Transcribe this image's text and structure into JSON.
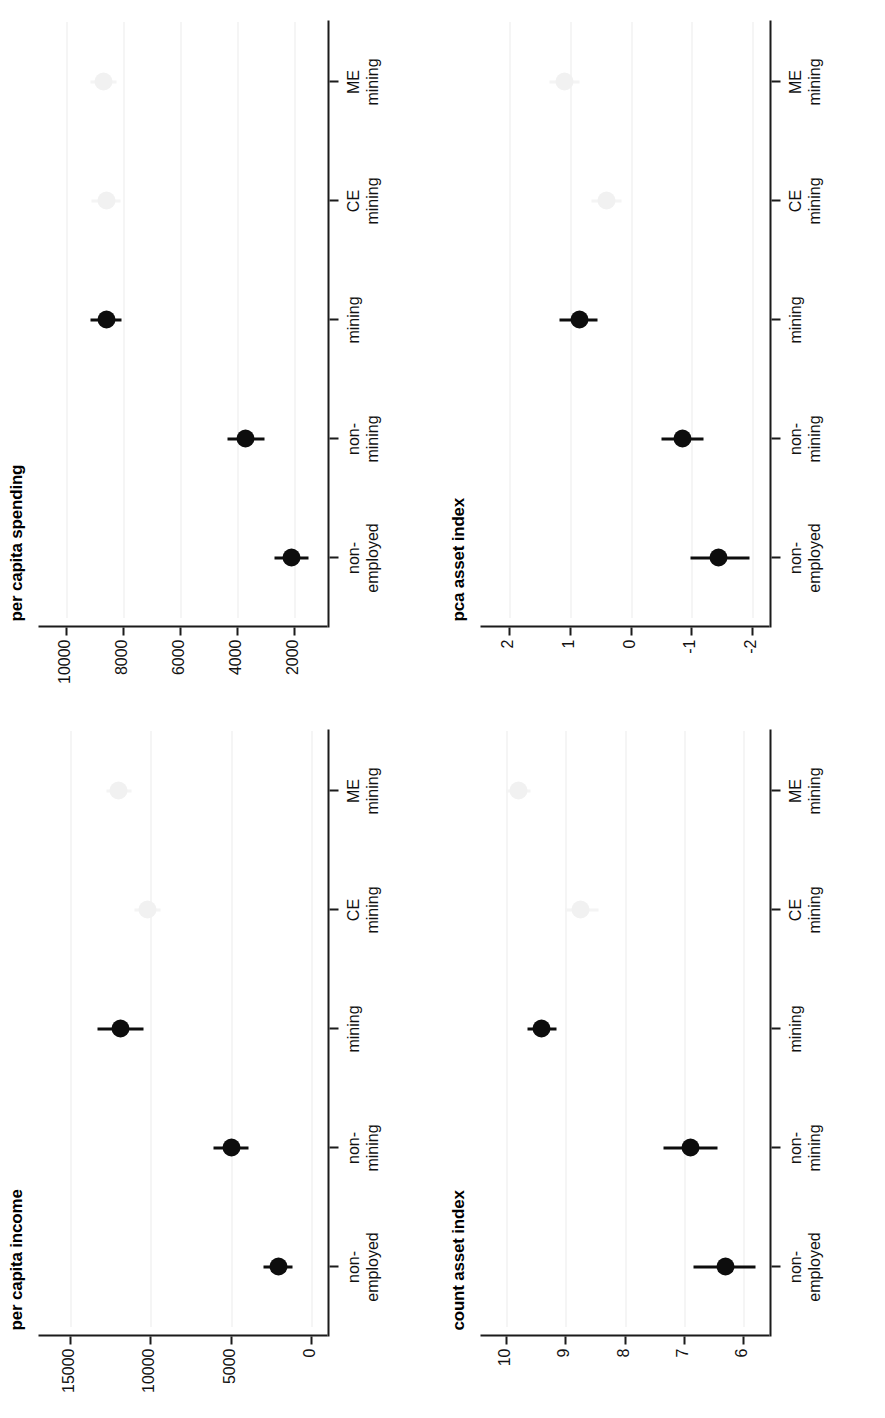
{
  "figure": {
    "layout": "2x2 grid of rotated dot-and-whisker plots",
    "orientation": "page rotated 90 degrees counter-clockwise",
    "background_color": "#ffffff",
    "marker_color": "#0d0d0d",
    "ghost_marker_color": "#f1f1f1",
    "gridline_color": "#d8d8d8",
    "axis_color": "#1b1b1b"
  },
  "categories": [
    {
      "line1": "non-",
      "line2": "employed"
    },
    {
      "line1": "non-",
      "line2": "mining"
    },
    {
      "line1": "mining",
      "line2": ""
    },
    {
      "line1": "CE",
      "line2": "mining"
    },
    {
      "line1": "ME",
      "line2": "mining"
    }
  ],
  "chart_data": [
    {
      "id": "per-capita-spending",
      "type": "scatter",
      "title": "per capita spending",
      "xlabel": "",
      "ylabel": "",
      "categories": [
        "non-employed",
        "non-mining",
        "mining",
        "CE mining",
        "ME mining"
      ],
      "ticks": [
        10000,
        8000,
        6000,
        4000,
        2000
      ],
      "ylim": [
        900,
        10900
      ],
      "grid": true,
      "legend": "none",
      "series": [
        {
          "name": "estimate",
          "values": [
            2100,
            3700,
            8600,
            8600,
            8700
          ],
          "ci_low": [
            1500,
            3050,
            8050,
            8100,
            8250
          ],
          "ci_high": [
            2700,
            4350,
            9150,
            9100,
            9150
          ],
          "faded": [
            false,
            false,
            false,
            true,
            true
          ]
        }
      ]
    },
    {
      "id": "pca-asset-index",
      "type": "scatter",
      "title": "pca asset index",
      "xlabel": "",
      "ylabel": "",
      "categories": [
        "non-employed",
        "non-mining",
        "mining",
        "CE mining",
        "ME mining"
      ],
      "ticks": [
        2,
        1,
        0,
        -1,
        -2
      ],
      "ylim": [
        -2.25,
        2.45
      ],
      "grid": true,
      "legend": "none",
      "series": [
        {
          "name": "estimate",
          "values": [
            -1.45,
            -0.85,
            0.85,
            0.4,
            1.1
          ],
          "ci_low": [
            -1.95,
            -1.2,
            0.55,
            0.15,
            0.85
          ],
          "ci_high": [
            -0.98,
            -0.5,
            1.18,
            0.65,
            1.35
          ],
          "faded": [
            false,
            false,
            false,
            true,
            true
          ]
        }
      ]
    },
    {
      "id": "per-capita-income",
      "type": "scatter",
      "title": "per capita income",
      "xlabel": "",
      "ylabel": "",
      "categories": [
        "non-employed",
        "non-mining",
        "mining",
        "CE mining",
        "ME mining"
      ],
      "ticks": [
        15000,
        10000,
        5000,
        0
      ],
      "ylim": [
        -900,
        16900
      ],
      "grid": true,
      "legend": "none",
      "series": [
        {
          "name": "estimate",
          "values": [
            2050,
            5000,
            11900,
            10200,
            12000
          ],
          "ci_low": [
            1150,
            3900,
            10450,
            9400,
            11200
          ],
          "ci_high": [
            2950,
            6100,
            13350,
            11000,
            12800
          ],
          "faded": [
            false,
            false,
            false,
            true,
            true
          ]
        }
      ]
    },
    {
      "id": "count-asset-index",
      "type": "scatter",
      "title": "count asset index",
      "xlabel": "",
      "ylabel": "",
      "categories": [
        "non-employed",
        "non-mining",
        "mining",
        "CE mining",
        "ME mining"
      ],
      "ticks": [
        10,
        9,
        8,
        7,
        6
      ],
      "ylim": [
        5.6,
        10.4
      ],
      "grid": true,
      "legend": "none",
      "series": [
        {
          "name": "estimate",
          "values": [
            6.3,
            6.9,
            9.4,
            8.75,
            9.8
          ],
          "ci_low": [
            5.8,
            6.45,
            9.15,
            8.45,
            9.6
          ],
          "ci_high": [
            6.85,
            7.35,
            9.65,
            9.0,
            10.0
          ],
          "faded": [
            false,
            false,
            false,
            true,
            true
          ]
        }
      ]
    }
  ]
}
